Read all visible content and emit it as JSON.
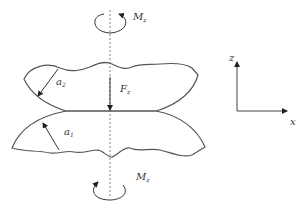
{
  "diagram": {
    "top_moment": {
      "symbol": "M",
      "subscript": "z"
    },
    "bottom_moment": {
      "symbol": "M",
      "subscript": "z"
    },
    "force": {
      "symbol": "F",
      "subscript": "z"
    },
    "upper_radius": {
      "symbol": "a",
      "subscript": "2"
    },
    "lower_radius": {
      "symbol": "a",
      "subscript": "1"
    },
    "axes": {
      "vertical": "z",
      "horizontal": "x"
    }
  },
  "colors": {
    "stroke": "#555555",
    "text": "#333333",
    "background": "#ffffff"
  }
}
